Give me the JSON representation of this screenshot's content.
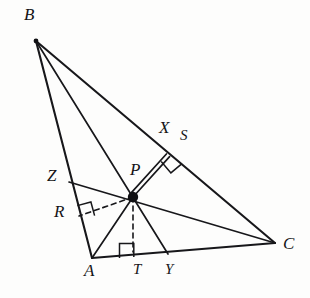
{
  "figure": {
    "stroke_color": "#17171a",
    "background_color": "#fdfdfc",
    "canvas": {
      "width": 310,
      "height": 298
    }
  },
  "points": {
    "B": {
      "label": "B",
      "x": 36,
      "y": 41,
      "label_x": 24,
      "label_y": 6
    },
    "A": {
      "label": "A",
      "x": 92,
      "y": 258,
      "label_x": 84,
      "label_y": 262
    },
    "C": {
      "label": "C",
      "x": 275,
      "y": 243,
      "label_x": 283,
      "label_y": 235
    },
    "P": {
      "label": "P",
      "x": 133,
      "y": 197,
      "label_x": 130,
      "label_y": 161
    },
    "X": {
      "label": "X",
      "x": 168,
      "y": 155,
      "label_x": 159,
      "label_y": 119
    },
    "S": {
      "label": "S",
      "x": 186,
      "y": 147,
      "label_x": 180,
      "label_y": 128
    },
    "Z": {
      "label": "Z",
      "x": 69,
      "y": 182,
      "label_x": 47,
      "label_y": 167
    },
    "R": {
      "label": "R",
      "x": 79,
      "y": 216,
      "label_x": 54,
      "label_y": 203
    },
    "T": {
      "label": "T",
      "x": 133,
      "y": 252,
      "label_x": 133,
      "label_y": 262
    },
    "Y": {
      "label": "Y",
      "x": 168,
      "y": 254,
      "label_x": 165,
      "label_y": 262
    }
  },
  "segments": [
    {
      "name": "side-BA",
      "from": "B",
      "to": "A",
      "style": "solid-main"
    },
    {
      "name": "side-BC",
      "from": "B",
      "to": "C",
      "style": "solid-main"
    },
    {
      "name": "side-AC",
      "from": "A",
      "to": "C",
      "style": "solid-main"
    },
    {
      "name": "cevian-B-to-Y",
      "from": "B",
      "to": "Y",
      "style": "solid"
    },
    {
      "name": "cevian-Z-to-C",
      "from": "Z",
      "to": "C",
      "style": "solid"
    },
    {
      "name": "cevian-A-to-P",
      "from": "A",
      "to": "P",
      "style": "solid"
    },
    {
      "name": "perpendicular-P-to-X",
      "from": "P",
      "to": "X",
      "style": "double"
    },
    {
      "name": "perpendicular-P-to-R",
      "from": "P",
      "to": "R",
      "style": "dashed"
    },
    {
      "name": "perpendicular-P-to-T",
      "from": "P",
      "to": "T",
      "style": "dashed"
    }
  ],
  "right_angles": [
    {
      "name": "right-angle-at-X",
      "vertex": "X",
      "size": 13
    },
    {
      "name": "right-angle-at-R",
      "vertex": "R",
      "size": 13
    },
    {
      "name": "right-angle-at-T",
      "vertex": "T",
      "size": 14
    }
  ],
  "labels": {
    "B": "B",
    "A": "A",
    "C": "C",
    "P": "P",
    "X": "X",
    "S": "S",
    "Z": "Z",
    "R": "R",
    "T": "T",
    "Y": "Y"
  }
}
